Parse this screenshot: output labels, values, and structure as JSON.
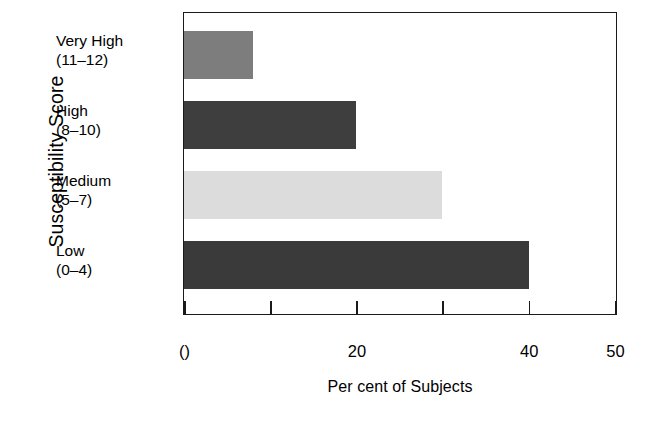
{
  "chart_data": {
    "type": "bar",
    "orientation": "horizontal",
    "title": "",
    "xlabel": "Per cent of Subjects",
    "ylabel": "Susceptibility Score",
    "categories": [
      "Very High\n(11–12)",
      "High\n(8–10)",
      "Medium\n(5–7)",
      "Low\n(0–4)"
    ],
    "category_lines": [
      {
        "name": "Very High",
        "range": "(11–12)"
      },
      {
        "name": "High",
        "range": "(8–10)"
      },
      {
        "name": "Medium",
        "range": "(5–7)"
      },
      {
        "name": "Low",
        "range": "(0–4)"
      }
    ],
    "values": [
      8,
      20,
      30,
      40
    ],
    "bar_colors": [
      "#7d7d7d",
      "#3e3e3e",
      "#dcdcdc",
      "#3a3a3a"
    ],
    "xlim": [
      0,
      50
    ],
    "xticks": [
      0,
      10,
      20,
      30,
      40,
      50
    ],
    "xtick_labels": [
      "()",
      "",
      "20",
      "",
      "40",
      "50"
    ],
    "grid": false,
    "legend": "none",
    "frame": "box"
  },
  "axis": {
    "y_title": "Susceptibility Score",
    "x_title": "Per cent of Subjects"
  },
  "bars": [
    {
      "label_line1": "Very High",
      "label_line2": "(11–12)",
      "value": 8,
      "color": "#7d7d7d"
    },
    {
      "label_line1": "High",
      "label_line2": "(8–10)",
      "value": 20,
      "color": "#3e3e3e"
    },
    {
      "label_line1": "Medium",
      "label_line2": "(5–7)",
      "value": 30,
      "color": "#dcdcdc"
    },
    {
      "label_line1": "Low",
      "label_line2": "(0–4)",
      "value": 40,
      "color": "#3a3a3a"
    }
  ],
  "ticks": [
    {
      "value": 0,
      "label": "()"
    },
    {
      "value": 10,
      "label": ""
    },
    {
      "value": 20,
      "label": "20"
    },
    {
      "value": 30,
      "label": ""
    },
    {
      "value": 40,
      "label": "40"
    },
    {
      "value": 50,
      "label": "50"
    }
  ]
}
